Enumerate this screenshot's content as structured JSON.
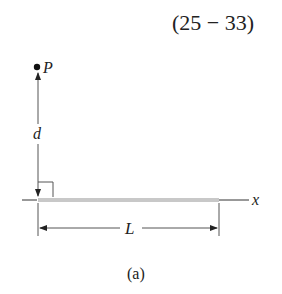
{
  "equation_number": "(25 − 33)",
  "point": {
    "label": "P"
  },
  "distance": {
    "label": "d"
  },
  "axis": {
    "label": "x"
  },
  "length": {
    "label": "L"
  },
  "caption": "(a)",
  "colors": {
    "ink": "#222222",
    "rod": "#bdbdbd",
    "line": "#555555"
  }
}
